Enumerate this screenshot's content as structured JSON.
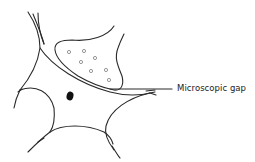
{
  "diagram": {
    "type": "neuron-synapse-sketch",
    "labels": [
      {
        "text": "Microscopic gap",
        "target": "synaptic-cleft"
      }
    ],
    "elements": {
      "presynaptic_terminal": {
        "vesicle_count": 7
      },
      "postsynaptic_cell": {
        "has_nucleus": true,
        "dendrite_count": 4
      }
    },
    "colors": {
      "stroke": "#2a2a2a",
      "nucleus": "#111111",
      "text": "#222222",
      "background": "#ffffff"
    }
  }
}
